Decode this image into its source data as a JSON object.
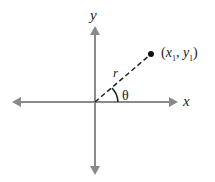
{
  "diagram": {
    "axes": {
      "x_label": "x",
      "y_label": "y",
      "color": "#8a8a8a"
    },
    "point": {
      "label_open": "(",
      "x_var": "x",
      "x_sub": "1",
      "comma": ", ",
      "y_var": "y",
      "y_sub": "1",
      "label_close": ")"
    },
    "radius_label": "r",
    "angle_label": "θ"
  }
}
